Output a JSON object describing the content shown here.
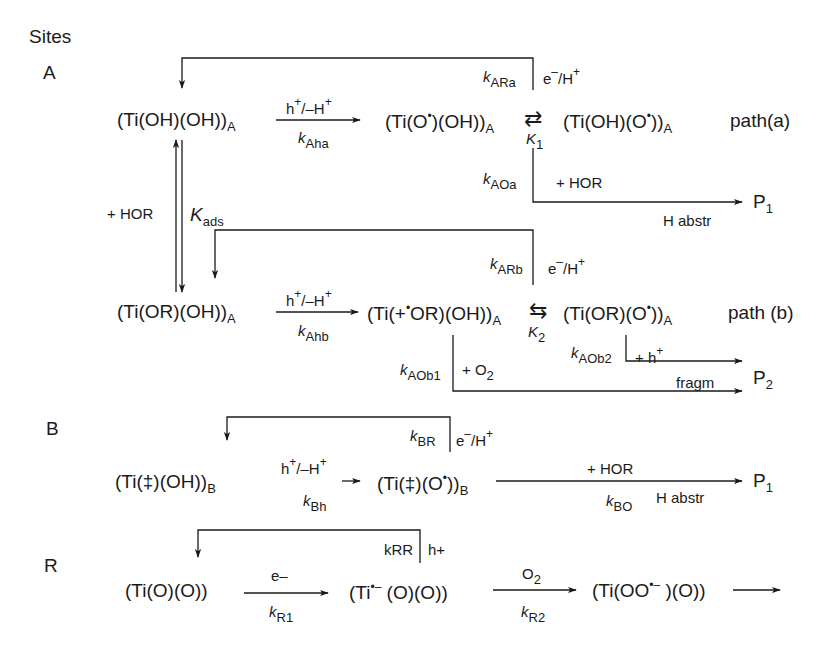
{
  "title": "Sites",
  "sites": {
    "A": "A",
    "B": "B",
    "R": "R"
  },
  "path_a": {
    "s1": "(Ti(OH)(OH))",
    "s1_sub": "A",
    "r1_top": "h",
    "r1_top_sup": "+",
    "r1_top_mid": "/–H",
    "r1_top_sup2": "+",
    "r1_k": "k",
    "r1_k_sub": "Aha",
    "s2": "(Ti(O",
    "s2_sup": "•",
    "s2_tail": ")(OH))",
    "s2_sub": "A",
    "eq_symbol": "⇄",
    "eq_K": "K",
    "eq_K_sub": "1",
    "s3": "(Ti(OH)(O",
    "s3_sup": "•",
    "s3_tail": "))",
    "s3_sub": "A",
    "label": "path(a)",
    "back_k": "k",
    "back_k_sub": "ARa",
    "back_reagent": "e",
    "back_reagent_sup": "–",
    "back_reagent_tail": "/H",
    "back_reagent_sup2": "+",
    "out_k": "k",
    "out_k_sub": "AOa",
    "out_reagent": "+ HOR",
    "out_note": "H abstr",
    "product": "P",
    "product_sub": "1"
  },
  "adsorption": {
    "reagent": "+ HOR",
    "K": "K",
    "K_sub": "ads"
  },
  "path_b": {
    "s1": "(Ti(OR)(OH))",
    "s1_sub": "A",
    "r1_top": "h",
    "r1_top_sup": "+",
    "r1_top_mid": "/–H",
    "r1_top_sup2": "+",
    "r1_k": "k",
    "r1_k_sub": "Ahb",
    "s2": "(Ti(+",
    "s2_sup": "•",
    "s2_tail": "OR)(OH))",
    "s2_sub": "A",
    "eq_symbol": "⇆",
    "eq_K": "K",
    "eq_K_sub": "2",
    "s3": "(Ti(OR)(O",
    "s3_sup": "•",
    "s3_tail": "))",
    "s3_sub": "A",
    "label": "path (b)",
    "back_k": "k",
    "back_k_sub": "ARb",
    "back_reagent": "e",
    "back_reagent_sup": "–",
    "back_reagent_tail": "/H",
    "back_reagent_sup2": "+",
    "out1_k": "k",
    "out1_k_sub": "AOb1",
    "out1_reagent": "+ O",
    "out1_reagent_sub": "2",
    "out1_note": "fragm",
    "out2_k": "k",
    "out2_k_sub": "AOb2",
    "out2_reagent": "+ h",
    "out2_reagent_sup": "+",
    "product": "P",
    "product_sub": "2"
  },
  "site_b": {
    "s1": "(Ti(‡)(OH))",
    "s1_sub": "B",
    "r1_top": "h",
    "r1_top_sup": "+",
    "r1_top_mid": "/–H",
    "r1_top_sup2": "+",
    "r1_k": "k",
    "r1_k_sub": "Bh",
    "s2": "(Ti(‡)(O",
    "s2_sup": "•",
    "s2_tail": "))",
    "s2_sub": "B",
    "back_k": "k",
    "back_k_sub": "BR",
    "back_reagent": "e",
    "back_reagent_sup": "–",
    "back_reagent_tail": "/H",
    "back_reagent_sup2": "+",
    "out_reagent": "+ HOR",
    "out_k": "k",
    "out_k_sub": "BO",
    "out_note": "H abstr",
    "product": "P",
    "product_sub": "1"
  },
  "site_r": {
    "s1": "(Ti(O)(O))",
    "r1_top": "e–",
    "r1_k": "k",
    "r1_k_sub": "R1",
    "s2": "(Ti",
    "s2_sup": "•–",
    "s2_tail": " (O)(O))",
    "r2_top": "O",
    "r2_top_sub": "2",
    "r2_k": "k",
    "r2_k_sub": "R2",
    "s3": "(Ti(OO",
    "s3_sup": "•–",
    "s3_tail": " )(O))",
    "back_k": "kRR",
    "back_reagent": "h+"
  },
  "colors": {
    "line": "#1a1a1a",
    "background": "#ffffff"
  }
}
